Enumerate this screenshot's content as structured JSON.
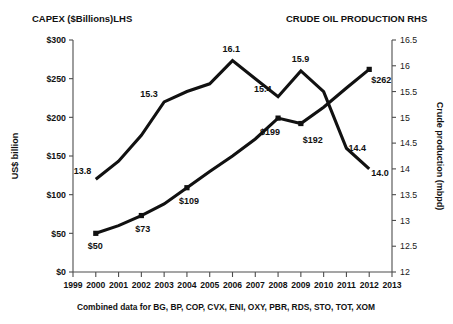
{
  "header": {
    "left_title": "CAPEX ($Billions)LHS",
    "right_title": "CRUDE OIL PRODUCTION RHS"
  },
  "footnote": "Combined data for BG, BP, COP, CVX, ENI, OXY, PBR, RDS, STO, TOT, XOM",
  "colors": {
    "series": "#111111",
    "axis": "#4d4d4d",
    "background": "#ffffff"
  },
  "chart_data": {
    "type": "line",
    "xlabel": "",
    "x": [
      1999,
      2000,
      2001,
      2002,
      2003,
      2004,
      2005,
      2006,
      2007,
      2008,
      2009,
      2010,
      2011,
      2012,
      2013
    ],
    "xtick_labels": [
      "1999",
      "2000",
      "2001",
      "2002",
      "2003",
      "2004",
      "2005",
      "2006",
      "2007",
      "2008",
      "2009",
      "2010",
      "2011",
      "2012",
      "2013"
    ],
    "xlim": [
      1999,
      2013
    ],
    "grid": false,
    "legend": "none",
    "left_axis": {
      "label": "US$ billion",
      "ylim": [
        0,
        300
      ],
      "ticks": [
        0,
        50,
        100,
        150,
        200,
        250,
        300
      ],
      "tick_labels": [
        "$0",
        "$50",
        "$100",
        "$150",
        "$200",
        "$250",
        "$300"
      ]
    },
    "right_axis": {
      "label": "Crude production (mbpd)",
      "ylim": [
        12,
        16.5
      ],
      "ticks": [
        12,
        12.5,
        13,
        13.5,
        14,
        14.5,
        15,
        15.5,
        16,
        16.5
      ],
      "tick_labels": [
        "12",
        "12.5",
        "13",
        "13.5",
        "14",
        "14.5",
        "15",
        "15.5",
        "16",
        "16.5"
      ]
    },
    "series": [
      {
        "name": "CAPEX ($Billions)LHS",
        "axis": "left",
        "marker": "square",
        "x": [
          2000,
          2001,
          2002,
          2003,
          2004,
          2005,
          2006,
          2007,
          2008,
          2009,
          2010,
          2011,
          2012
        ],
        "values": [
          50,
          60,
          73,
          88,
          109,
          130,
          150,
          172,
          199,
          192,
          213,
          238,
          262
        ],
        "point_labels": [
          {
            "x": 2000,
            "value": 50,
            "text": "$50",
            "dx": -8,
            "dy": 16
          },
          {
            "x": 2002,
            "value": 73,
            "text": "$73",
            "dx": -6,
            "dy": 16
          },
          {
            "x": 2004,
            "value": 109,
            "text": "$109",
            "dx": -8,
            "dy": 16
          },
          {
            "x": 2008,
            "value": 199,
            "text": "$199",
            "dx": -18,
            "dy": 17
          },
          {
            "x": 2009,
            "value": 192,
            "text": "$192",
            "dx": 2,
            "dy": 19
          },
          {
            "x": 2012,
            "value": 262,
            "text": "$262",
            "dx": 2,
            "dy": 14
          }
        ]
      },
      {
        "name": "CRUDE OIL PRODUCTION RHS",
        "axis": "right",
        "marker": "none",
        "x": [
          2000,
          2001,
          2002,
          2003,
          2004,
          2005,
          2006,
          2007,
          2008,
          2009,
          2010,
          2011,
          2012
        ],
        "values": [
          13.8,
          14.15,
          14.65,
          15.3,
          15.5,
          15.65,
          16.1,
          15.75,
          15.4,
          15.9,
          15.5,
          14.4,
          14.0
        ],
        "point_labels": [
          {
            "x": 2000,
            "value": 13.8,
            "text": "13.8",
            "dx": -22,
            "dy": -5
          },
          {
            "x": 2003,
            "value": 15.3,
            "text": "15.3",
            "dx": -24,
            "dy": -5
          },
          {
            "x": 2006,
            "value": 16.1,
            "text": "16.1",
            "dx": -10,
            "dy": -9
          },
          {
            "x": 2008,
            "value": 15.4,
            "text": "15.4",
            "dx": -24,
            "dy": -5
          },
          {
            "x": 2009,
            "value": 15.9,
            "text": "15.9",
            "dx": -9,
            "dy": -9
          },
          {
            "x": 2011,
            "value": 14.4,
            "text": "14.4",
            "dx": 2,
            "dy": 3
          },
          {
            "x": 2012,
            "value": 14.0,
            "text": "14.0",
            "dx": 2,
            "dy": 7
          }
        ]
      }
    ]
  }
}
